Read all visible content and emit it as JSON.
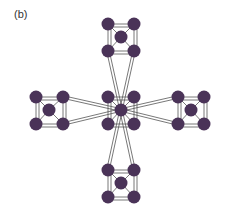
{
  "figure": {
    "label": "(b)",
    "node_color": "#4a3358",
    "edge_color": "#555555",
    "node_radius": 6.5,
    "groups": [
      {
        "name": "top",
        "nodes": [
          [
            108,
            24
          ],
          [
            134,
            24
          ],
          [
            121,
            37
          ],
          [
            108,
            51
          ],
          [
            134,
            51
          ]
        ]
      },
      {
        "name": "center",
        "nodes": [
          [
            108,
            97
          ],
          [
            134,
            97
          ],
          [
            121,
            110
          ],
          [
            108,
            124
          ],
          [
            134,
            124
          ]
        ]
      },
      {
        "name": "left",
        "nodes": [
          [
            36,
            97
          ],
          [
            63,
            97
          ],
          [
            49,
            110
          ],
          [
            36,
            124
          ],
          [
            63,
            124
          ]
        ]
      },
      {
        "name": "right",
        "nodes": [
          [
            178,
            97
          ],
          [
            204,
            97
          ],
          [
            191,
            110
          ],
          [
            178,
            124
          ],
          [
            204,
            124
          ]
        ]
      },
      {
        "name": "bottom",
        "nodes": [
          [
            108,
            170
          ],
          [
            134,
            170
          ],
          [
            121,
            183
          ],
          [
            108,
            197
          ],
          [
            134,
            197
          ]
        ]
      }
    ],
    "hub": [
      121,
      110
    ],
    "spokes": [
      {
        "from": [
          108,
          51
        ],
        "to": [
          121,
          110
        ]
      },
      {
        "from": [
          134,
          51
        ],
        "to": [
          121,
          110
        ]
      },
      {
        "from": [
          63,
          97
        ],
        "to": [
          121,
          110
        ]
      },
      {
        "from": [
          63,
          124
        ],
        "to": [
          121,
          110
        ]
      },
      {
        "from": [
          178,
          97
        ],
        "to": [
          121,
          110
        ]
      },
      {
        "from": [
          178,
          124
        ],
        "to": [
          121,
          110
        ]
      },
      {
        "from": [
          108,
          170
        ],
        "to": [
          121,
          110
        ]
      },
      {
        "from": [
          134,
          170
        ],
        "to": [
          121,
          110
        ]
      }
    ]
  }
}
